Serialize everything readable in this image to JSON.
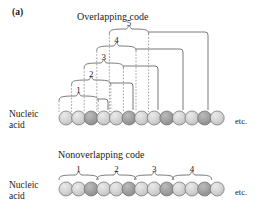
{
  "figure": {
    "panel_letter": "(a)",
    "background": "#ffffff",
    "ink": "#1a1a1a"
  },
  "sections": [
    {
      "id": "overlapping",
      "title": "Overlapping code",
      "title_x": 77,
      "title_y": 12,
      "row_label_line1": "Nucleic",
      "row_label_line2": "acid",
      "row_label_x": 9,
      "row_label_y": 110,
      "etc_label": "etc.",
      "etc_x": 235,
      "etc_y": 117,
      "chain_y": 118,
      "bead_radius": 7.0,
      "bead_spacing": 12.6,
      "bead_start_x": 66,
      "bead_count": 13,
      "bead_pattern": [
        "light",
        "light",
        "dark"
      ],
      "codons": [
        {
          "label": "1",
          "start_bead": 1,
          "end_bead": 3,
          "bracket_y": 96,
          "label_y": 86,
          "drop_x": 108.0
        },
        {
          "label": "2",
          "start_bead": 2,
          "end_bead": 4,
          "bracket_y": 80,
          "label_y": 70,
          "drop_x": 133.0
        },
        {
          "label": "3",
          "start_bead": 3,
          "end_bead": 5,
          "bracket_y": 63,
          "label_y": 53,
          "drop_x": 158.0
        },
        {
          "label": "4",
          "start_bead": 4,
          "end_bead": 6,
          "bracket_y": 46,
          "label_y": 36,
          "drop_x": 183.0
        },
        {
          "label": "5",
          "start_bead": 5,
          "end_bead": 7,
          "bracket_y": 29,
          "label_y": 19,
          "drop_x": 208.0
        }
      ]
    },
    {
      "id": "nonoverlapping",
      "title": "Nonoverlapping code",
      "title_x": 58,
      "title_y": 150,
      "row_label_line1": "Nucleic",
      "row_label_line2": "acid",
      "row_label_x": 9,
      "row_label_y": 181,
      "etc_label": "etc.",
      "etc_x": 235,
      "etc_y": 188,
      "chain_y": 189,
      "bead_radius": 7.0,
      "bead_spacing": 12.6,
      "bead_start_x": 66,
      "bead_count": 13,
      "bead_pattern": [
        "light",
        "light",
        "dark"
      ],
      "codons": [
        {
          "label": "1",
          "start_bead": 1,
          "end_bead": 3,
          "bracket_y": 175,
          "label_y": 165
        },
        {
          "label": "2",
          "start_bead": 4,
          "end_bead": 6,
          "bracket_y": 175,
          "label_y": 165
        },
        {
          "label": "3",
          "start_bead": 7,
          "end_bead": 9,
          "bracket_y": 175,
          "label_y": 165
        },
        {
          "label": "4",
          "start_bead": 10,
          "end_bead": 12,
          "bracket_y": 175,
          "label_y": 165
        }
      ]
    }
  ],
  "colors": {
    "bead_light_fill": "#cfcfcf",
    "bead_light_highlight": "#e6e6e6",
    "bead_dark_fill": "#9a9a9a",
    "bead_dark_highlight": "#b8b8b8",
    "bead_stroke": "#6d6d6d",
    "line_stroke": "#555555",
    "dashed_stroke": "#8a8a8a"
  }
}
